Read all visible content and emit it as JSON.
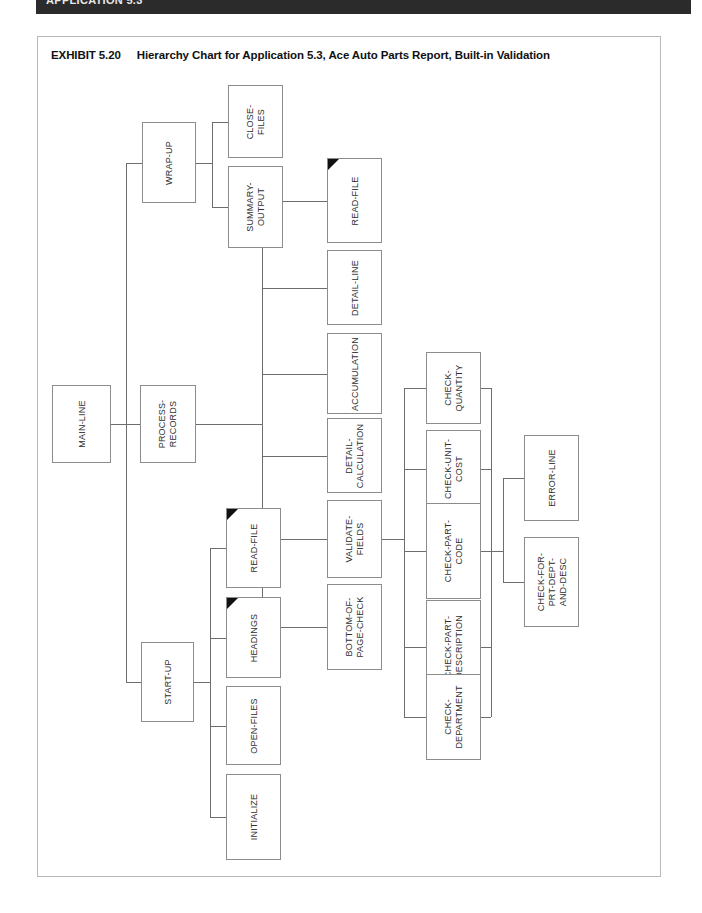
{
  "running_head": {
    "text": "APPLICATION 5.3"
  },
  "exhibit": {
    "number": "EXHIBIT 5.20",
    "title": "Hierarchy Chart for Application 5.3, Ace Auto Parts Report, Built-in Validation"
  },
  "chart_data": {
    "type": "diagram",
    "diagram_type": "hierarchy-chart",
    "orientation": "left-to-right, labels rotated 90 degrees counter-clockwise",
    "title": "Hierarchy Chart for Application 5.3, Ace Auto Parts Report, Built-in Validation",
    "legend": "A solid black triangle in a box's upper-left corner marks a duplicated / previously-detailed module.",
    "root": "MAIN-LINE",
    "nodes": [
      {
        "id": "main-line",
        "label": "MAIN-LINE",
        "level": 1,
        "marked": false,
        "x": 52,
        "y": 385,
        "w": 59,
        "h": 78
      },
      {
        "id": "wrap-up",
        "label": "WRAP-UP",
        "level": 2,
        "marked": false,
        "x": 142,
        "y": 122,
        "w": 54,
        "h": 81
      },
      {
        "id": "close-files",
        "label": "CLOSE-\nFILES",
        "level": 3,
        "marked": false,
        "x": 228,
        "y": 85,
        "w": 55,
        "h": 73
      },
      {
        "id": "summary-output",
        "label": "SUMMARY-\nOUTPUT",
        "level": 3,
        "marked": false,
        "x": 228,
        "y": 166,
        "w": 55,
        "h": 82
      },
      {
        "id": "process-records",
        "label": "PROCESS-\nRECORDS",
        "level": 2,
        "marked": false,
        "x": 140,
        "y": 385,
        "w": 56,
        "h": 78
      },
      {
        "id": "read-file-process",
        "label": "READ-FILE",
        "level": 3,
        "marked": true,
        "x": 327,
        "y": 158,
        "w": 55,
        "h": 85
      },
      {
        "id": "detail-line",
        "label": "DETAIL-LINE",
        "level": 3,
        "marked": false,
        "x": 327,
        "y": 250,
        "w": 55,
        "h": 75
      },
      {
        "id": "accumulation",
        "label": "ACCUMULATION",
        "level": 3,
        "marked": false,
        "x": 327,
        "y": 333,
        "w": 55,
        "h": 81
      },
      {
        "id": "detail-calculation",
        "label": "DETAIL-\nCALCULATION",
        "level": 3,
        "marked": false,
        "x": 327,
        "y": 418,
        "w": 55,
        "h": 75
      },
      {
        "id": "validate-fields",
        "label": "VALIDATE-\nFIELDS",
        "level": 3,
        "marked": false,
        "x": 327,
        "y": 500,
        "w": 55,
        "h": 78
      },
      {
        "id": "bottom-of-page-check",
        "label": "BOTTOM-OF-\nPAGE-CHECK",
        "level": 3,
        "marked": false,
        "x": 327,
        "y": 584,
        "w": 55,
        "h": 86
      },
      {
        "id": "check-quantity",
        "label": "CHECK-\nQUANTITY",
        "level": 4,
        "marked": false,
        "x": 426,
        "y": 352,
        "w": 55,
        "h": 72
      },
      {
        "id": "check-unit-cost",
        "label": "CHECK-UNIT-\nCOST",
        "level": 4,
        "marked": false,
        "x": 426,
        "y": 430,
        "w": 55,
        "h": 78
      },
      {
        "id": "check-part-code",
        "label": "CHECK-PART-\nCODE",
        "level": 4,
        "marked": false,
        "x": 426,
        "y": 503,
        "w": 55,
        "h": 96
      },
      {
        "id": "check-part-description",
        "label": "CHECK-PART-\nDESCRIPTION",
        "level": 4,
        "marked": false,
        "x": 426,
        "y": 600,
        "w": 55,
        "h": 93
      },
      {
        "id": "check-department",
        "label": "CHECK-\nDEPARTMENT",
        "level": 4,
        "marked": false,
        "x": 426,
        "y": 674,
        "w": 55,
        "h": 86
      },
      {
        "id": "error-line",
        "label": "ERROR-LINE",
        "level": 5,
        "marked": false,
        "x": 524,
        "y": 435,
        "w": 55,
        "h": 86
      },
      {
        "id": "check-for-prt-dept",
        "label": "CHECK-FOR-\nPRT-DEPT-\nAND-DESC",
        "level": 5,
        "marked": false,
        "x": 524,
        "y": 537,
        "w": 55,
        "h": 90
      },
      {
        "id": "start-up",
        "label": "START-UP",
        "level": 2,
        "marked": false,
        "x": 141,
        "y": 642,
        "w": 53,
        "h": 80
      },
      {
        "id": "read-file-startup",
        "label": "READ-FILE",
        "level": 3,
        "marked": true,
        "x": 226,
        "y": 508,
        "w": 55,
        "h": 80
      },
      {
        "id": "headings",
        "label": "HEADINGS",
        "level": 3,
        "marked": true,
        "x": 226,
        "y": 597,
        "w": 55,
        "h": 81
      },
      {
        "id": "open-files",
        "label": "OPEN-FILES",
        "level": 3,
        "marked": false,
        "x": 226,
        "y": 686,
        "w": 55,
        "h": 79
      },
      {
        "id": "initialize",
        "label": "INITIALIZE",
        "level": 3,
        "marked": false,
        "x": 226,
        "y": 774,
        "w": 55,
        "h": 86
      }
    ],
    "edges": [
      {
        "from": "main-line",
        "to": "wrap-up"
      },
      {
        "from": "main-line",
        "to": "process-records"
      },
      {
        "from": "main-line",
        "to": "start-up"
      },
      {
        "from": "wrap-up",
        "to": "close-files"
      },
      {
        "from": "wrap-up",
        "to": "summary-output"
      },
      {
        "from": "process-records",
        "to": "read-file-process"
      },
      {
        "from": "process-records",
        "to": "detail-line"
      },
      {
        "from": "process-records",
        "to": "accumulation"
      },
      {
        "from": "process-records",
        "to": "detail-calculation"
      },
      {
        "from": "process-records",
        "to": "validate-fields"
      },
      {
        "from": "process-records",
        "to": "bottom-of-page-check"
      },
      {
        "from": "validate-fields",
        "to": "check-quantity"
      },
      {
        "from": "validate-fields",
        "to": "check-unit-cost"
      },
      {
        "from": "validate-fields",
        "to": "check-part-code"
      },
      {
        "from": "validate-fields",
        "to": "check-part-description"
      },
      {
        "from": "validate-fields",
        "to": "check-department"
      },
      {
        "from": "check-quantity",
        "to": "error-line"
      },
      {
        "from": "check-unit-cost",
        "to": "error-line"
      },
      {
        "from": "check-part-code",
        "to": "error-line"
      },
      {
        "from": "check-part-description",
        "to": "error-line"
      },
      {
        "from": "check-department",
        "to": "error-line"
      },
      {
        "from": "check-part-code",
        "to": "check-for-prt-dept"
      },
      {
        "from": "start-up",
        "to": "read-file-startup"
      },
      {
        "from": "start-up",
        "to": "headings"
      },
      {
        "from": "start-up",
        "to": "open-files"
      },
      {
        "from": "start-up",
        "to": "initialize"
      }
    ]
  }
}
